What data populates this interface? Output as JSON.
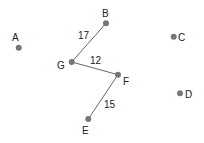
{
  "graph": {
    "nodes": [
      {
        "id": "A",
        "label": "A",
        "x": 18.7,
        "y": 47.7,
        "lx": 12,
        "ly": 41
      },
      {
        "id": "B",
        "label": "B",
        "x": 106,
        "y": 23.3,
        "lx": 102,
        "ly": 17
      },
      {
        "id": "C",
        "label": "C",
        "x": 173.7,
        "y": 36.7,
        "lx": 178,
        "ly": 40.5
      },
      {
        "id": "D",
        "label": "D",
        "x": 180,
        "y": 93.3,
        "lx": 185,
        "ly": 98
      },
      {
        "id": "E",
        "label": "E",
        "x": 88.3,
        "y": 119,
        "lx": 82,
        "ly": 134
      },
      {
        "id": "F",
        "label": "F",
        "x": 118,
        "y": 74.7,
        "lx": 123,
        "ly": 85
      },
      {
        "id": "G",
        "label": "G",
        "x": 71.7,
        "y": 62,
        "lx": 57,
        "ly": 69
      }
    ],
    "edges": [
      {
        "from": "G",
        "to": "B",
        "weight": "17",
        "lx": 78,
        "ly": 39
      },
      {
        "from": "G",
        "to": "F",
        "weight": "12",
        "lx": 90,
        "ly": 64
      },
      {
        "from": "F",
        "to": "E",
        "weight": "15",
        "lx": 104,
        "ly": 108
      }
    ],
    "colors": {
      "node": "#777777",
      "edge": "#666666",
      "text": "#222222"
    }
  }
}
